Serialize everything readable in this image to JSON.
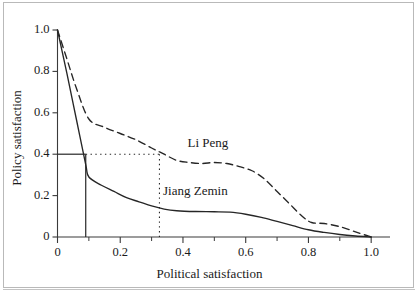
{
  "figure": {
    "background": "#ffffff",
    "border_color": "#b9b9b9"
  },
  "chart_data": {
    "type": "line",
    "title": "",
    "xlabel": "Political satisfaction",
    "ylabel": "Policy satisfaction",
    "xlim": [
      0,
      1.06
    ],
    "ylim": [
      0,
      1.0
    ],
    "grid": false,
    "legend_position": "inline-annotations",
    "x_ticks": [
      "0",
      "0.2",
      "0.4",
      "0.6",
      "0.8",
      "1.0"
    ],
    "x_tick_values": [
      0,
      0.2,
      0.4,
      0.6,
      0.8,
      1.0
    ],
    "x_minor_tick_values": [
      0.1,
      0.3,
      0.5,
      0.7,
      0.9
    ],
    "y_ticks": [
      "0",
      "0.2",
      "0.4",
      "0.6",
      "0.8",
      "1.0"
    ],
    "y_tick_values": [
      0,
      0.2,
      0.4,
      0.6,
      0.8,
      1.0
    ],
    "series": [
      {
        "name": "Li Peng",
        "style": "dashed",
        "color": "#262626",
        "points": [
          [
            0.0,
            1.0
          ],
          [
            0.03,
            0.86
          ],
          [
            0.06,
            0.72
          ],
          [
            0.1,
            0.57
          ],
          [
            0.15,
            0.53
          ],
          [
            0.2,
            0.5
          ],
          [
            0.25,
            0.47
          ],
          [
            0.3,
            0.43
          ],
          [
            0.34,
            0.4
          ],
          [
            0.38,
            0.37
          ],
          [
            0.42,
            0.36
          ],
          [
            0.46,
            0.355
          ],
          [
            0.5,
            0.36
          ],
          [
            0.54,
            0.355
          ],
          [
            0.58,
            0.34
          ],
          [
            0.62,
            0.32
          ],
          [
            0.66,
            0.28
          ],
          [
            0.7,
            0.22
          ],
          [
            0.74,
            0.16
          ],
          [
            0.78,
            0.1
          ],
          [
            0.81,
            0.07
          ],
          [
            0.85,
            0.065
          ],
          [
            0.9,
            0.05
          ],
          [
            0.95,
            0.025
          ],
          [
            1.0,
            0.0
          ]
        ]
      },
      {
        "name": "Jiang Zemin",
        "style": "solid",
        "color": "#262626",
        "points": [
          [
            0.0,
            1.0
          ],
          [
            0.03,
            0.79
          ],
          [
            0.06,
            0.57
          ],
          [
            0.09,
            0.35
          ],
          [
            0.1,
            0.29
          ],
          [
            0.14,
            0.25
          ],
          [
            0.18,
            0.22
          ],
          [
            0.22,
            0.19
          ],
          [
            0.26,
            0.17
          ],
          [
            0.3,
            0.15
          ],
          [
            0.34,
            0.135
          ],
          [
            0.38,
            0.127
          ],
          [
            0.44,
            0.123
          ],
          [
            0.5,
            0.122
          ],
          [
            0.55,
            0.12
          ],
          [
            0.6,
            0.11
          ],
          [
            0.65,
            0.095
          ],
          [
            0.7,
            0.075
          ],
          [
            0.75,
            0.055
          ],
          [
            0.8,
            0.035
          ],
          [
            0.85,
            0.022
          ],
          [
            0.9,
            0.012
          ],
          [
            0.95,
            0.005
          ],
          [
            1.0,
            0.0
          ]
        ]
      }
    ],
    "annotations": [
      {
        "name": "reference-horizontal-solid",
        "style": "solid",
        "from": [
          0.0,
          0.4
        ],
        "to": [
          0.09,
          0.4
        ]
      },
      {
        "name": "reference-vertical-solid",
        "style": "solid",
        "from": [
          0.09,
          0.4
        ],
        "to": [
          0.09,
          0.0
        ]
      },
      {
        "name": "reference-horizontal-dotted",
        "style": "dotted",
        "from": [
          0.09,
          0.4
        ],
        "to": [
          0.325,
          0.4
        ]
      },
      {
        "name": "reference-vertical-dotted",
        "style": "dotted",
        "from": [
          0.325,
          0.4
        ],
        "to": [
          0.325,
          0.0
        ]
      }
    ],
    "series_labels": [
      {
        "text": "Li Peng",
        "x": 0.48,
        "y": 0.45
      },
      {
        "text": "Jiang Zemin",
        "x": 0.44,
        "y": 0.215
      }
    ]
  }
}
